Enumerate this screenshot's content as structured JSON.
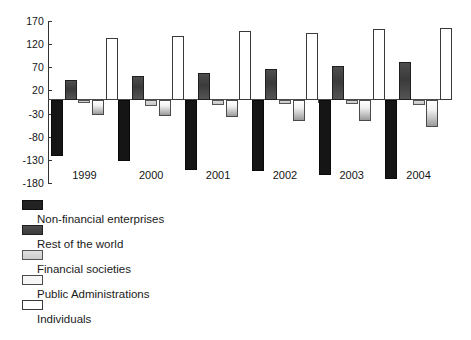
{
  "chart_data": {
    "type": "bar",
    "title": "",
    "subtitle": "",
    "xlabel": "",
    "ylabel": "",
    "categories": [
      "1999",
      "2000",
      "2001",
      "2002",
      "2003",
      "2004"
    ],
    "ylim": [
      -180,
      170
    ],
    "yticks": [
      170,
      120,
      70,
      20,
      -30,
      -80,
      -130,
      -180
    ],
    "ytick_labels": [
      "170",
      "120",
      "70",
      "20",
      "-30",
      "-80",
      "-130",
      "-180"
    ],
    "grid": false,
    "legend_position": "below-left",
    "zero_line": 0,
    "series": [
      {
        "name": "Non-financial enterprises",
        "color": "#151515",
        "values": [
          -122,
          -133,
          -152,
          -155,
          -163,
          -172
        ]
      },
      {
        "name": "Rest of the world",
        "color": "#434343",
        "values": [
          42,
          52,
          58,
          67,
          72,
          82
        ]
      },
      {
        "name": "Financial societies",
        "color": "#d2d2d2",
        "values": [
          -8,
          -13,
          -12,
          -10,
          -9,
          -11
        ]
      },
      {
        "name": "Public Administrations",
        "color": "#f2f2f2",
        "values": [
          -33,
          -36,
          -37,
          -45,
          -46,
          -58
        ]
      },
      {
        "name": "Individuals",
        "color": "#ffffff",
        "values": [
          134,
          137,
          148,
          145,
          152,
          155
        ]
      }
    ]
  }
}
